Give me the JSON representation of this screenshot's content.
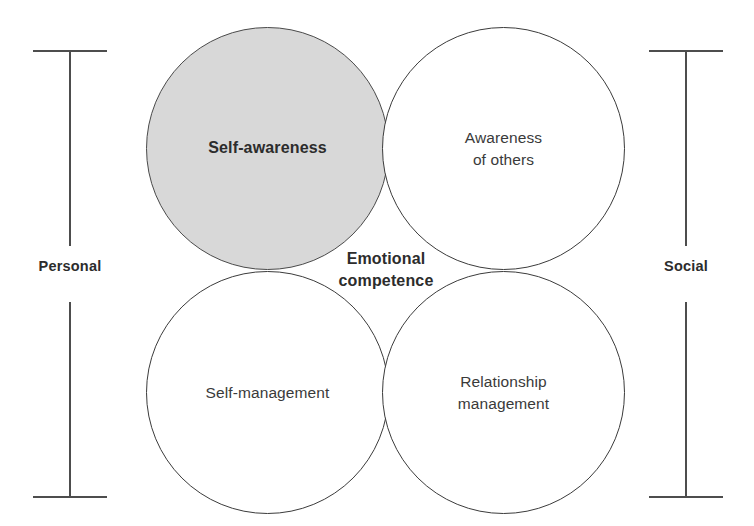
{
  "diagram": {
    "title": "Emotional competence",
    "center_label": "Emotional\ncompetence",
    "background_color": "#ffffff",
    "circles": [
      {
        "id": "self-awareness",
        "label": "Self-awareness",
        "quadrant": "top-left",
        "fill_color": "#d8d8d8",
        "stroke_color": "#4a4a4a",
        "emphasis": "bold",
        "highlighted": "true"
      },
      {
        "id": "awareness-of-others",
        "label": "Awareness\nof others",
        "quadrant": "top-right",
        "fill_color": "#ffffff",
        "stroke_color": "#3b3b3b",
        "emphasis": "normal",
        "highlighted": "false"
      },
      {
        "id": "self-management",
        "label": "Self-management",
        "quadrant": "bottom-left",
        "fill_color": "#ffffff",
        "stroke_color": "#3b3b3b",
        "emphasis": "normal",
        "highlighted": "false"
      },
      {
        "id": "relationship-management",
        "label": "Relationship\nmanagement",
        "quadrant": "bottom-right",
        "fill_color": "#ffffff",
        "stroke_color": "#3b3b3b",
        "emphasis": "normal",
        "highlighted": "false"
      }
    ],
    "brackets": [
      {
        "id": "personal",
        "label": "Personal",
        "side": "left",
        "spans": "Self-awareness and Self-management",
        "color": "#4d4d4d"
      },
      {
        "id": "social",
        "label": "Social",
        "side": "right",
        "spans": "Awareness of others and Relationship management",
        "color": "#4d4d4d"
      }
    ]
  }
}
